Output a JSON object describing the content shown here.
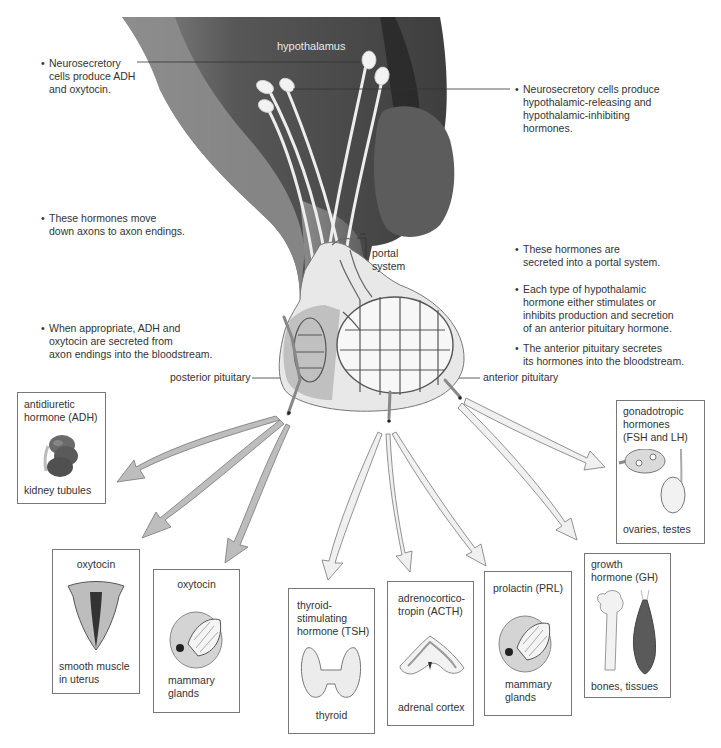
{
  "diagram": {
    "structures": {
      "hypothalamus": "hypothalamus",
      "portal_system": "portal\nsystem",
      "posterior_pituitary": "posterior pituitary",
      "anterior_pituitary": "anterior pituitary"
    },
    "left_notes": [
      "Neurosecretory\ncells produce ADH\nand oxytocin.",
      "These hormones move\ndown axons to axon endings.",
      "When appropriate, ADH and\noxytocin are secreted from\naxon endings into the bloodstream."
    ],
    "right_notes": [
      "Neurosecretory cells produce\nhypothalamic-releasing and\nhypothalamic-inhibiting\nhormones.",
      "These hormones are\nsecreted into a portal system.",
      "Each type of hypothalamic\nhormone either stimulates or\ninhibits production and secretion\nof an anterior pituitary hormone.",
      "The anterior pituitary secretes\nits hormones into the bloodstream."
    ],
    "targets": [
      {
        "hormone": "antidiuretic\nhormone (ADH)",
        "target": "kidney tubules",
        "icon": "kidney-icon",
        "source": "posterior"
      },
      {
        "hormone": "oxytocin",
        "target": "smooth muscle\nin uterus",
        "icon": "uterus-icon",
        "source": "posterior"
      },
      {
        "hormone": "oxytocin",
        "target": "mammary\nglands",
        "icon": "mammary-gland-icon",
        "source": "posterior"
      },
      {
        "hormone": "thyroid-\nstimulating\nhormone (TSH)",
        "target": "thyroid",
        "icon": "thyroid-icon",
        "source": "anterior"
      },
      {
        "hormone": "adrenocortico-\ntropin (ACTH)",
        "target": "adrenal cortex",
        "icon": "adrenal-icon",
        "source": "anterior"
      },
      {
        "hormone": "prolactin (PRL)",
        "target": "mammary\nglands",
        "icon": "mammary-gland-icon",
        "source": "anterior"
      },
      {
        "hormone": "growth\nhormone (GH)",
        "target": "bones, tissues",
        "icon": "bone-muscle-icon",
        "source": "anterior"
      },
      {
        "hormone": "gonadotropic\nhormones\n(FSH and LH)",
        "target": "ovaries, testes",
        "icon": "ovary-testis-icon",
        "source": "anterior"
      }
    ],
    "colors": {
      "brain_dark": "#4a4a4a",
      "brain_mid": "#6e6e6e",
      "posterior_arrow": "#bdbdbd",
      "anterior_arrow": "#f0f0f0",
      "card_border": "#777777"
    }
  }
}
